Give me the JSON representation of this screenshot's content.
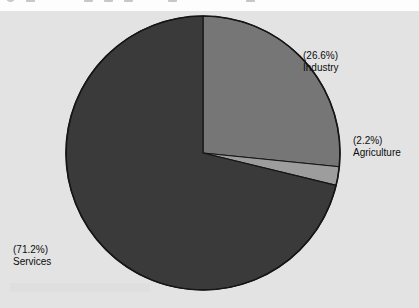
{
  "toolbar": {
    "visible_sliver": true,
    "icons": [
      {
        "name": "toolbar-icon-1",
        "shape": "round",
        "x": 6
      },
      {
        "name": "toolbar-icon-2",
        "shape": "square",
        "x": 26
      },
      {
        "name": "toolbar-icon-3",
        "shape": "square",
        "x": 84
      },
      {
        "name": "toolbar-icon-4",
        "shape": "square",
        "x": 104
      },
      {
        "name": "toolbar-icon-5",
        "shape": "square",
        "x": 124
      },
      {
        "name": "toolbar-icon-6",
        "shape": "square",
        "x": 168
      },
      {
        "name": "toolbar-icon-7",
        "shape": "square",
        "x": 246
      }
    ]
  },
  "chart_data": {
    "type": "pie",
    "title": "",
    "subtitle": "",
    "xlabel": "",
    "ylabel": "",
    "legend_position": "none",
    "grid": false,
    "labels_show_percent": true,
    "start_angle_deg": 0,
    "direction": "clockwise",
    "categories": [
      "Industry",
      "Agriculture",
      "Services"
    ],
    "values": [
      26.6,
      2.2,
      71.2
    ],
    "units": "percent",
    "slices": [
      {
        "name": "Industry",
        "value": 26.6,
        "percent_text": "(26.6%)",
        "label_text": "Industry",
        "color": "#767676",
        "start_deg": 0,
        "end_deg": 95.76
      },
      {
        "name": "Agriculture",
        "value": 2.2,
        "percent_text": "(2.2%)",
        "label_text": "Agriculture",
        "color": "#9d9d9d",
        "start_deg": 95.76,
        "end_deg": 103.68
      },
      {
        "name": "Services",
        "value": 71.2,
        "percent_text": "(71.2%)",
        "label_text": "Services",
        "color": "#3a3a3a",
        "start_deg": 103.68,
        "end_deg": 360
      }
    ],
    "annotations": [
      {
        "name": "industry-label",
        "percent": "(26.6%)",
        "label": "Industry"
      },
      {
        "name": "agriculture-label",
        "percent": "(2.2%)",
        "label": "Agriculture"
      },
      {
        "name": "services-label",
        "percent": "(71.2%)",
        "label": "Services"
      }
    ]
  },
  "style": {
    "canvas_background": "#e3e3e3",
    "page_background": "#ffffff",
    "slice_outline": "#151515",
    "label_color": "#0d0d0d",
    "industry_color": "#767676",
    "agriculture_color": "#9d9d9d",
    "services_color": "#3a3a3a"
  },
  "geometry": {
    "center_x": 203,
    "center_y": 142,
    "radius": 137
  }
}
